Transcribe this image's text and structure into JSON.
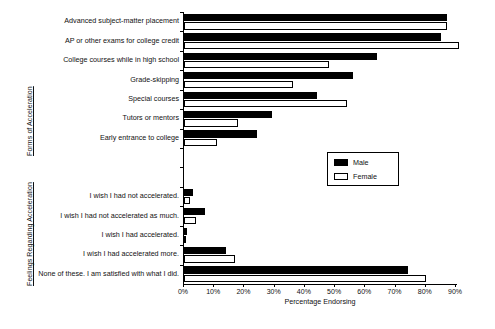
{
  "chart_data": {
    "type": "bar",
    "orientation": "horizontal",
    "title": "",
    "xlabel": "Percentage Endorsing",
    "ylabel": "",
    "xlim": [
      0,
      90
    ],
    "xticks": [
      "0%",
      "10%",
      "20%",
      "30%",
      "40%",
      "50%",
      "60%",
      "70%",
      "80%",
      "90%"
    ],
    "xtick_values": [
      0,
      10,
      20,
      30,
      40,
      50,
      60,
      70,
      80,
      90
    ],
    "grid": false,
    "legend": {
      "position": "center-right",
      "entries": [
        {
          "name": "Male",
          "fill": "#000000",
          "stroke": "#000000"
        },
        {
          "name": "Female",
          "fill": "#ffffff",
          "stroke": "#000000"
        }
      ]
    },
    "group_axis_titles": [
      {
        "id": "forms",
        "label": "Forms of Acceleration"
      },
      {
        "id": "feelings",
        "label": "Feelings Regarding Acceleration"
      }
    ],
    "series": [
      {
        "name": "Male",
        "values": [
          87,
          85,
          64,
          56,
          44,
          29,
          24,
          3,
          7,
          1,
          14,
          74
        ]
      },
      {
        "name": "Female",
        "values": [
          87,
          91,
          48,
          36,
          54,
          18,
          11,
          2,
          4,
          0.5,
          17,
          80
        ]
      }
    ],
    "categories": [
      "Advanced subject-matter placement",
      "AP or other exams for college credit",
      "College courses while in high school",
      "Grade-skipping",
      "Special courses",
      "Tutors or mentors",
      "Early entrance to college",
      "I wish I had not accelerated.",
      "I wish I had not accelerated as much.",
      "I wish I had accelerated.",
      "I wish I had accelerated more.",
      "None of these. I am satisfied with what I did."
    ],
    "category_groups": [
      {
        "title": "Forms of Acceleration",
        "items": [
          {
            "label": "Advanced subject-matter placement",
            "male": 87,
            "female": 87
          },
          {
            "label": "AP or other exams for college credit",
            "male": 85,
            "female": 91
          },
          {
            "label": "College courses while in high school",
            "male": 64,
            "female": 48
          },
          {
            "label": "Grade-skipping",
            "male": 56,
            "female": 36
          },
          {
            "label": "Special courses",
            "male": 44,
            "female": 54
          },
          {
            "label": "Tutors or mentors",
            "male": 29,
            "female": 18
          },
          {
            "label": "Early entrance to college",
            "male": 24,
            "female": 11
          }
        ]
      },
      {
        "title": "Feelings Regarding Acceleration",
        "items": [
          {
            "label": "I wish I had not accelerated.",
            "male": 3,
            "female": 2
          },
          {
            "label": "I wish I had not accelerated as much.",
            "male": 7,
            "female": 4
          },
          {
            "label": "I wish I had accelerated.",
            "male": 1,
            "female": 0.5
          },
          {
            "label": "I wish I had accelerated more.",
            "male": 14,
            "female": 17
          },
          {
            "label": "None of these. I am satisfied with what I did.",
            "male": 74,
            "female": 80
          }
        ]
      }
    ]
  },
  "colors": {
    "male": "#000000",
    "female": "#ffffff",
    "axis": "#000000",
    "background": "#ffffff"
  }
}
